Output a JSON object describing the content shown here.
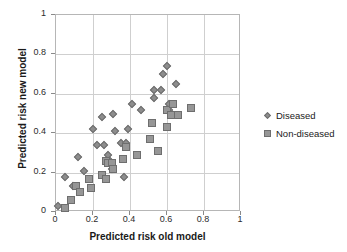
{
  "chart_data": {
    "type": "scatter",
    "title": "",
    "xlabel": "Predicted risk old model",
    "ylabel": "Predicted risk new model",
    "xlim": [
      0,
      1
    ],
    "ylim": [
      0,
      1
    ],
    "xticks": [
      "0",
      "0.2",
      "0.4",
      "0.6",
      "0.8",
      "1"
    ],
    "yticks": [
      "0",
      "0.2",
      "0.4",
      "0.6",
      "0.8",
      "1"
    ],
    "xtick_values": [
      0,
      0.2,
      0.4,
      0.6,
      0.8,
      1
    ],
    "ytick_values": [
      0,
      0.2,
      0.4,
      0.6,
      0.8,
      1
    ],
    "grid": true,
    "legend_position": "right",
    "series": [
      {
        "name": "Diseased",
        "marker": "diamond",
        "color": "#8d8d8d",
        "points": [
          [
            0.01,
            0.03
          ],
          [
            0.05,
            0.18
          ],
          [
            0.09,
            0.13
          ],
          [
            0.12,
            0.28
          ],
          [
            0.15,
            0.21
          ],
          [
            0.2,
            0.42
          ],
          [
            0.22,
            0.34
          ],
          [
            0.25,
            0.48
          ],
          [
            0.26,
            0.34
          ],
          [
            0.28,
            0.29
          ],
          [
            0.29,
            0.26
          ],
          [
            0.3,
            0.22
          ],
          [
            0.31,
            0.5
          ],
          [
            0.32,
            0.41
          ],
          [
            0.35,
            0.35
          ],
          [
            0.37,
            0.18
          ],
          [
            0.38,
            0.35
          ],
          [
            0.39,
            0.42
          ],
          [
            0.41,
            0.55
          ],
          [
            0.46,
            0.52
          ],
          [
            0.53,
            0.58
          ],
          [
            0.53,
            0.62
          ],
          [
            0.57,
            0.62
          ],
          [
            0.58,
            0.7
          ],
          [
            0.6,
            0.74
          ],
          [
            0.61,
            0.55
          ],
          [
            0.61,
            0.52
          ],
          [
            0.65,
            0.65
          ]
        ]
      },
      {
        "name": "Non-diseased",
        "marker": "square",
        "color": "#969696",
        "points": [
          [
            0.05,
            0.02
          ],
          [
            0.08,
            0.06
          ],
          [
            0.11,
            0.13
          ],
          [
            0.13,
            0.1
          ],
          [
            0.18,
            0.17
          ],
          [
            0.19,
            0.12
          ],
          [
            0.25,
            0.19
          ],
          [
            0.27,
            0.26
          ],
          [
            0.27,
            0.17
          ],
          [
            0.28,
            0.25
          ],
          [
            0.3,
            0.25
          ],
          [
            0.31,
            0.22
          ],
          [
            0.36,
            0.27
          ],
          [
            0.38,
            0.33
          ],
          [
            0.44,
            0.29
          ],
          [
            0.51,
            0.37
          ],
          [
            0.52,
            0.45
          ],
          [
            0.55,
            0.31
          ],
          [
            0.6,
            0.52
          ],
          [
            0.6,
            0.43
          ],
          [
            0.62,
            0.49
          ],
          [
            0.63,
            0.55
          ],
          [
            0.66,
            0.49
          ],
          [
            0.73,
            0.53
          ]
        ]
      }
    ]
  }
}
